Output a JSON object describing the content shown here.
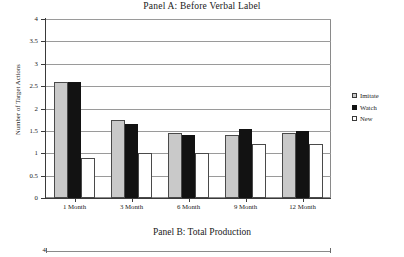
{
  "figure": {
    "panelA": {
      "title": "Panel A: Before Verbal Label",
      "ylabel": "Number of Target Actions"
    },
    "panelB": {
      "title": "Panel B: Total Production",
      "top_tick": "4"
    }
  },
  "chart_data": {
    "type": "bar",
    "title": "Panel A: Before Verbal Label",
    "xlabel": "",
    "ylabel": "Number of Target Actions",
    "ylim": [
      0,
      4
    ],
    "yticks": [
      "0",
      "0.5",
      "1",
      "1.5",
      "2",
      "2.5",
      "3",
      "3.5",
      "4"
    ],
    "ytick_values": [
      0,
      0.5,
      1,
      1.5,
      2,
      2.5,
      3,
      3.5,
      4
    ],
    "grid": true,
    "legend_position": "right",
    "categories": [
      "1 Month",
      "3 Month",
      "6 Month",
      "9 Month",
      "12 Month"
    ],
    "series": [
      {
        "name": "Imitate",
        "color": "#c9c9c9",
        "values": [
          2.6,
          1.75,
          1.45,
          1.4,
          1.45
        ]
      },
      {
        "name": "Watch",
        "color": "#121212",
        "values": [
          2.6,
          1.65,
          1.4,
          1.55,
          1.5
        ]
      },
      {
        "name": "New",
        "color": "#ffffff",
        "values": [
          0.9,
          1.0,
          1.0,
          1.2,
          1.2
        ]
      }
    ]
  }
}
